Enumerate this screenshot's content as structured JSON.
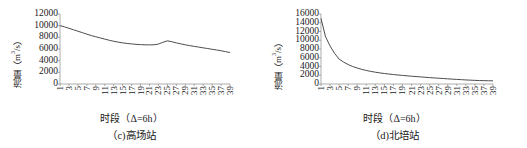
{
  "figure": {
    "panels": [
      {
        "id": "panel-c",
        "caption": "（c)高场站",
        "xlabel": "时段（Δ=6h）",
        "ylabel_main": "流量",
        "ylabel_unit": "（m",
        "ylabel_sup": "3",
        "ylabel_tail": "/s）"
      },
      {
        "id": "panel-d",
        "caption": "（d)北培站",
        "xlabel": "时段（Δ=6h）",
        "ylabel_main": "流量",
        "ylabel_unit": "（m",
        "ylabel_sup": "3",
        "ylabel_tail": "/s）"
      }
    ]
  },
  "chart_data": [
    {
      "type": "line",
      "id": "gaochang-station",
      "title": "（c)高场站",
      "xlabel": "时段（Δ=6h）",
      "ylabel": "流量（m3/s）",
      "grid": false,
      "legend": "none",
      "line_color": "#4d4d4d",
      "xlim": [
        1,
        39
      ],
      "ylim": [
        0,
        12000
      ],
      "yticks": [
        0,
        2000,
        4000,
        6000,
        8000,
        10000,
        12000
      ],
      "xticks": [
        1,
        3,
        5,
        7,
        9,
        11,
        13,
        15,
        17,
        19,
        21,
        23,
        25,
        27,
        29,
        31,
        33,
        35,
        37,
        39
      ],
      "x": [
        1,
        2,
        3,
        4,
        5,
        6,
        7,
        8,
        9,
        10,
        11,
        12,
        13,
        14,
        15,
        16,
        17,
        18,
        19,
        20,
        21,
        22,
        23,
        24,
        25,
        26,
        27,
        28,
        29,
        30,
        31,
        32,
        33,
        34,
        35,
        36,
        37,
        38,
        39
      ],
      "values": [
        10000,
        9800,
        9550,
        9300,
        9050,
        8800,
        8550,
        8300,
        8100,
        7900,
        7700,
        7500,
        7330,
        7180,
        7050,
        6950,
        6870,
        6800,
        6750,
        6720,
        6700,
        6720,
        6850,
        7150,
        7400,
        7250,
        7050,
        6880,
        6720,
        6580,
        6450,
        6330,
        6200,
        6080,
        5950,
        5830,
        5700,
        5550,
        5400
      ]
    },
    {
      "type": "line",
      "id": "beipei-station",
      "title": "（d)北培站",
      "xlabel": "时段（Δ=6h）",
      "ylabel": "流量（m3/s）",
      "grid": false,
      "legend": "none",
      "line_color": "#4d4d4d",
      "xlim": [
        1,
        39
      ],
      "ylim": [
        0,
        16000
      ],
      "yticks": [
        0,
        2000,
        4000,
        6000,
        8000,
        10000,
        12000,
        14000,
        16000
      ],
      "xticks": [
        1,
        3,
        5,
        7,
        9,
        11,
        13,
        15,
        17,
        19,
        21,
        23,
        25,
        27,
        29,
        31,
        33,
        35,
        37,
        39
      ],
      "x": [
        1,
        2,
        3,
        4,
        5,
        6,
        7,
        8,
        9,
        10,
        11,
        12,
        13,
        14,
        15,
        16,
        17,
        18,
        19,
        20,
        21,
        22,
        23,
        24,
        25,
        26,
        27,
        28,
        29,
        30,
        31,
        32,
        33,
        34,
        35,
        36,
        37,
        38,
        39
      ],
      "values": [
        15000,
        10800,
        8700,
        7000,
        5700,
        5000,
        4450,
        4000,
        3650,
        3350,
        3100,
        2880,
        2700,
        2540,
        2400,
        2280,
        2160,
        2060,
        1960,
        1870,
        1780,
        1700,
        1620,
        1540,
        1460,
        1390,
        1320,
        1250,
        1180,
        1110,
        1050,
        990,
        930,
        880,
        830,
        790,
        760,
        740,
        730
      ]
    }
  ]
}
